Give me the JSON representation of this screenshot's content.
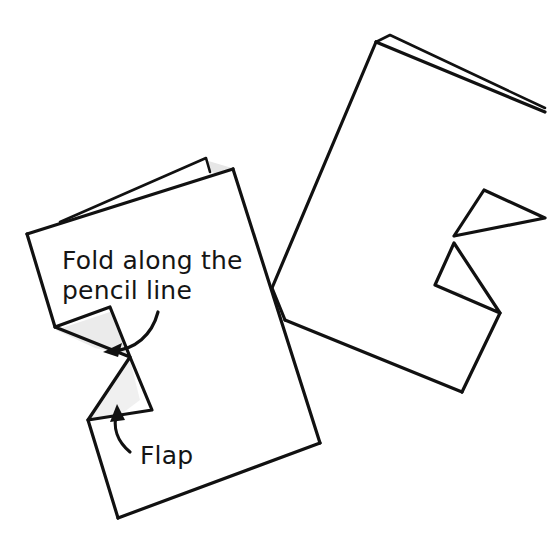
{
  "illustration": {
    "description": "Hand-drawn sketch of two sheets of paper with folded corner flaps",
    "labels": {
      "fold_instruction_line1": "Fold along the",
      "fold_instruction_line2": "pencil line",
      "flap": "Flap"
    },
    "colors": {
      "ink": "#111111",
      "shading": "#e6e6e6",
      "background": "#ffffff"
    }
  }
}
